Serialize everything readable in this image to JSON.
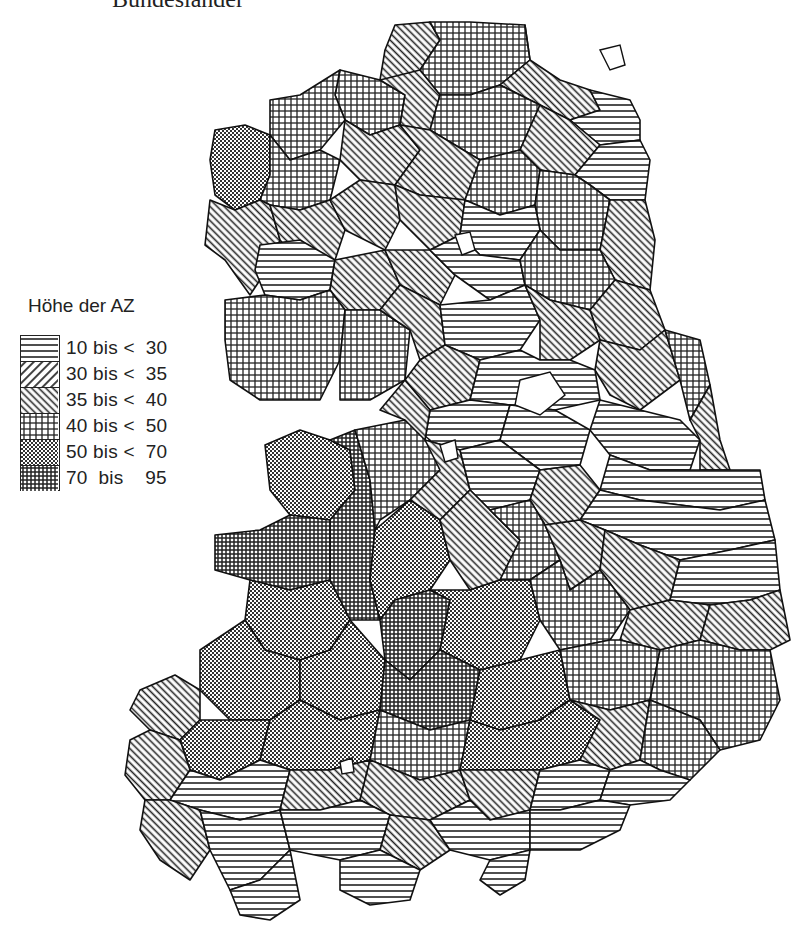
{
  "title": "Bundesländer",
  "legend": {
    "title": "Höhe der AZ",
    "classes": [
      {
        "label": "10 bis <  30",
        "pattern": "horizontal-lines",
        "min": 10,
        "max": 30
      },
      {
        "label": "30 bis <  35",
        "pattern": "diagonal-lines-down",
        "min": 30,
        "max": 35
      },
      {
        "label": "35 bis <  40",
        "pattern": "diagonal-lines-up",
        "min": 35,
        "max": 40
      },
      {
        "label": "40 bis <  50",
        "pattern": "grid",
        "min": 40,
        "max": 50
      },
      {
        "label": "50 bis <  70",
        "pattern": "checker",
        "min": 50,
        "max": 70
      },
      {
        "label": "70  bis    95",
        "pattern": "dense-grid",
        "min": 70,
        "max": 95
      }
    ]
  },
  "map": {
    "type": "choropleth",
    "region": "East Germany districts (Kreise)",
    "colors": {
      "ink": "#222222",
      "background": "#ffffff"
    }
  }
}
